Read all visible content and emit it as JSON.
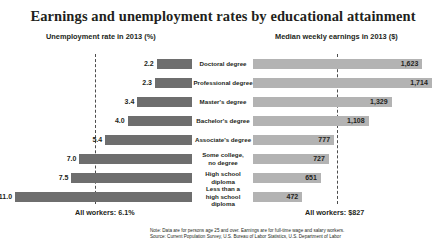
{
  "title": "Earnings and unemployment rates by educational attainment",
  "headers": {
    "left": "Unemployment rate in 2013 (%)",
    "right": "Median weekly earnings in 2013 ($)"
  },
  "summary": {
    "left": "All workers: 6.1%",
    "right": "All workers: $827"
  },
  "note": {
    "line1": "Note: Data are for persons age 25 and over. Earnings are for full-time wage and salary workers.",
    "line2": "Source: Current Population Survey, U.S. Bureau of Labor Statistics, U.S. Department of Labor"
  },
  "chart_data": {
    "type": "bar",
    "title": "Earnings and unemployment rates by educational attainment",
    "orientation": "horizontal-diverging",
    "categories": [
      "Doctoral degree",
      "Professional degree",
      "Master's degree",
      "Bachelor's degree",
      "Associate's degree",
      "Some college,\nno degree",
      "High school diploma",
      "Less than a\nhigh school diploma"
    ],
    "series": [
      {
        "name": "Unemployment rate in 2013 (%)",
        "side": "left",
        "unit": "%",
        "values": [
          2.2,
          2.3,
          3.4,
          4.0,
          5.4,
          7.0,
          7.5,
          11.0
        ],
        "labels": [
          "2.2",
          "2.3",
          "3.4",
          "4.0",
          "5.4",
          "7.0",
          "7.5",
          "11.0"
        ],
        "color": "#6e6e6e",
        "axis_max": 12.0,
        "reference_line": {
          "value": 6.1,
          "label": "All workers: 6.1%",
          "style": "dashed"
        }
      },
      {
        "name": "Median weekly earnings in 2013 ($)",
        "side": "right",
        "unit": "$",
        "values": [
          1623,
          1714,
          1329,
          1108,
          777,
          727,
          651,
          472
        ],
        "labels": [
          "1,623",
          "1,714",
          "1,329",
          "1,108",
          "777",
          "727",
          "651",
          "472"
        ],
        "color": "#b3b3b3",
        "axis_max": 1850,
        "reference_line": {
          "value": 827,
          "label": "All workers: $827",
          "style": "dashed"
        }
      }
    ],
    "grid": false,
    "legend": "none",
    "xlabel": "",
    "ylabel": ""
  }
}
